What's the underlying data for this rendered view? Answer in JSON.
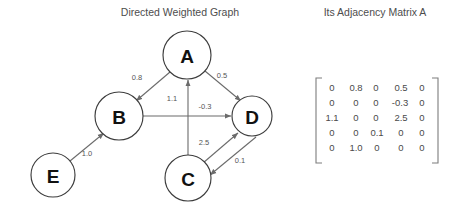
{
  "graph_panel": {
    "title": "Directed Weighted Graph",
    "nodes": [
      {
        "id": "A",
        "label": "A",
        "cx": 187,
        "cy": 55,
        "r": 24
      },
      {
        "id": "B",
        "label": "B",
        "cx": 119,
        "cy": 116,
        "r": 24
      },
      {
        "id": "C",
        "label": "C",
        "cx": 188,
        "cy": 178,
        "r": 23
      },
      {
        "id": "D",
        "label": "D",
        "cx": 252,
        "cy": 116,
        "r": 20
      },
      {
        "id": "E",
        "label": "E",
        "cx": 53,
        "cy": 175,
        "r": 22
      }
    ],
    "edges": [
      {
        "from": "A",
        "to": "B",
        "weight": "0.8",
        "lx": 137,
        "ly": 78
      },
      {
        "from": "A",
        "to": "D",
        "weight": "0.5",
        "lx": 222,
        "ly": 76
      },
      {
        "from": "C",
        "to": "A",
        "weight": "1.1",
        "lx": 172,
        "ly": 99
      },
      {
        "from": "B",
        "to": "D",
        "weight": "-0.3",
        "lx": 205,
        "ly": 107
      },
      {
        "from": "C",
        "to": "D",
        "weight": "2.5",
        "lx": 204,
        "ly": 143
      },
      {
        "from": "D",
        "to": "C",
        "weight": "0.1",
        "lx": 240,
        "ly": 161
      },
      {
        "from": "E",
        "to": "B",
        "weight": "1.0",
        "lx": 87,
        "ly": 154
      }
    ]
  },
  "matrix_panel": {
    "title": "Its Adjacency Matrix A",
    "rows": [
      [
        "0",
        "0.8",
        "0",
        "0.5",
        "0"
      ],
      [
        "0",
        "0",
        "0",
        "-0.3",
        "0"
      ],
      [
        "1.1",
        "0",
        "0",
        "2.5",
        "0"
      ],
      [
        "0",
        "0",
        "0.1",
        "0",
        "0"
      ],
      [
        "0",
        "1.0",
        "0",
        "0",
        "0"
      ]
    ]
  },
  "colors": {
    "background": "#ffffff",
    "node_stroke": "#3d3d3d",
    "edge_stroke": "#6b6b6b",
    "text": "#4a4a4a"
  }
}
